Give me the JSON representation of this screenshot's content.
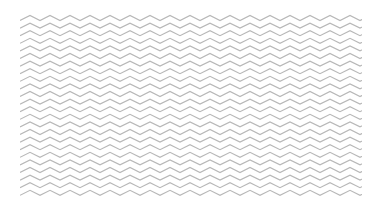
{
  "image": {
    "description": "Zigzag chevron line pattern",
    "background_color": "#ffffff",
    "line_color": "#b8b8b8",
    "pattern": {
      "left": 20,
      "top": 13,
      "width": 342,
      "height": 184,
      "period_x": 20,
      "amplitude": 5,
      "row_spacing": 7.6,
      "rows": 24,
      "stroke_width": 1.2
    }
  }
}
